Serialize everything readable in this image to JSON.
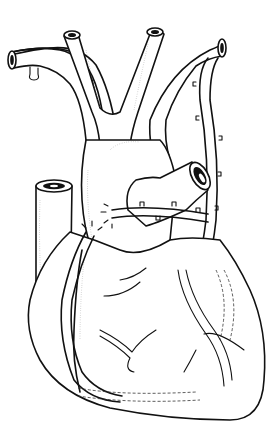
{
  "figure": {
    "style": "black line art on white",
    "background": "#ffffff",
    "stroke_color": "#111111",
    "parts": [
      {
        "id": "aortic-arch",
        "label": ""
      },
      {
        "id": "brachiocephalic-trunk",
        "label": ""
      },
      {
        "id": "left-common-carotid",
        "label": ""
      },
      {
        "id": "left-subclavian",
        "label": ""
      },
      {
        "id": "superior-vena-cava",
        "label": ""
      },
      {
        "id": "pulmonary-trunk",
        "label": ""
      },
      {
        "id": "right-atrium",
        "label": ""
      },
      {
        "id": "ventricles",
        "label": ""
      },
      {
        "id": "internal-mammary-graft",
        "label": ""
      },
      {
        "id": "saphenous-vein-graft",
        "label": ""
      },
      {
        "id": "coronary-branches",
        "label": ""
      }
    ]
  }
}
